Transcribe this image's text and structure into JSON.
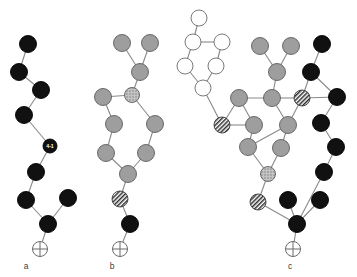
{
  "figure": {
    "background_color": "#ffffff",
    "width": 357,
    "height": 277,
    "edge_color": "#8a8a8a",
    "node_colors": {
      "black": "#111111",
      "gray": "#9e9e9e",
      "white": "#ffffff",
      "hatch": "#3a3a3a",
      "speck": "#b4b4b4",
      "outline": "#5e5e5e"
    }
  },
  "panels": [
    {
      "id": "a",
      "label": "a",
      "label_pos": {
        "x": 26,
        "y": 269
      },
      "root_marker": {
        "name": "crossed-circle-root",
        "x": 40,
        "y": 249,
        "r": 7.5
      },
      "nodes": [
        {
          "id": "a0",
          "x": 28,
          "y": 44,
          "r": 8.5,
          "style": "black",
          "label": ""
        },
        {
          "id": "a1",
          "x": 19,
          "y": 72,
          "r": 8.5,
          "style": "black",
          "label": ""
        },
        {
          "id": "a2",
          "x": 41,
          "y": 90,
          "r": 8.5,
          "style": "black",
          "label": ""
        },
        {
          "id": "a3",
          "x": 24,
          "y": 115,
          "r": 8.5,
          "style": "black",
          "label": ""
        },
        {
          "id": "a4",
          "x": 50,
          "y": 146,
          "r": 7.0,
          "style": "black",
          "label": "4-1"
        },
        {
          "id": "a5",
          "x": 36,
          "y": 172,
          "r": 8.5,
          "style": "black",
          "label": ""
        },
        {
          "id": "a6",
          "x": 26,
          "y": 200,
          "r": 8.5,
          "style": "black",
          "label": ""
        },
        {
          "id": "a7",
          "x": 68,
          "y": 198,
          "r": 8.5,
          "style": "black",
          "label": ""
        },
        {
          "id": "a8",
          "x": 48,
          "y": 224,
          "r": 8.5,
          "style": "black",
          "label": ""
        }
      ],
      "edges": [
        [
          "a0",
          "a1"
        ],
        [
          "a1",
          "a2"
        ],
        [
          "a2",
          "a3"
        ],
        [
          "a3",
          "a4"
        ],
        [
          "a4",
          "a5"
        ],
        [
          "a5",
          "a6"
        ],
        [
          "a6",
          "a8"
        ],
        [
          "a7",
          "a8"
        ]
      ],
      "root_edge_from": "a8"
    },
    {
      "id": "b",
      "label": "b",
      "label_pos": {
        "x": 112,
        "y": 269
      },
      "root_marker": {
        "name": "crossed-circle-root",
        "x": 120,
        "y": 249,
        "r": 7.5
      },
      "nodes": [
        {
          "id": "b0",
          "x": 122,
          "y": 43,
          "r": 8.5,
          "style": "gray",
          "label": ""
        },
        {
          "id": "b1",
          "x": 150,
          "y": 43,
          "r": 8.5,
          "style": "gray",
          "label": ""
        },
        {
          "id": "b2",
          "x": 140,
          "y": 72,
          "r": 8.5,
          "style": "gray",
          "label": ""
        },
        {
          "id": "b3",
          "x": 103,
          "y": 97,
          "r": 8.5,
          "style": "gray",
          "label": ""
        },
        {
          "id": "b4",
          "x": 132,
          "y": 95,
          "r": 7.5,
          "style": "speck",
          "label": ""
        },
        {
          "id": "b5",
          "x": 114,
          "y": 124,
          "r": 8.5,
          "style": "gray",
          "label": ""
        },
        {
          "id": "b6",
          "x": 155,
          "y": 124,
          "r": 8.5,
          "style": "gray",
          "label": ""
        },
        {
          "id": "b7",
          "x": 106,
          "y": 153,
          "r": 8.5,
          "style": "gray",
          "label": ""
        },
        {
          "id": "b8",
          "x": 146,
          "y": 153,
          "r": 8.5,
          "style": "gray",
          "label": ""
        },
        {
          "id": "b9",
          "x": 128,
          "y": 174,
          "r": 8.5,
          "style": "gray",
          "label": ""
        },
        {
          "id": "b10",
          "x": 120,
          "y": 199,
          "r": 8.0,
          "style": "hatch",
          "label": ""
        },
        {
          "id": "b11",
          "x": 130,
          "y": 224,
          "r": 8.5,
          "style": "black",
          "label": ""
        }
      ],
      "edges": [
        [
          "b0",
          "b2"
        ],
        [
          "b1",
          "b2"
        ],
        [
          "b2",
          "b4"
        ],
        [
          "b3",
          "b4"
        ],
        [
          "b3",
          "b5"
        ],
        [
          "b4",
          "b6"
        ],
        [
          "b5",
          "b7"
        ],
        [
          "b6",
          "b8"
        ],
        [
          "b7",
          "b9"
        ],
        [
          "b8",
          "b9"
        ],
        [
          "b9",
          "b10"
        ],
        [
          "b10",
          "b11"
        ]
      ],
      "root_edge_from": "b11"
    },
    {
      "id": "c",
      "label": "c",
      "label_pos": {
        "x": 290,
        "y": 269
      },
      "root_marker": {
        "name": "crossed-circle-root",
        "x": 293,
        "y": 249,
        "r": 7.5
      },
      "nodes": [
        {
          "id": "c0",
          "x": 199,
          "y": 18,
          "r": 8.0,
          "style": "white",
          "label": ""
        },
        {
          "id": "c1",
          "x": 193,
          "y": 42,
          "r": 8.0,
          "style": "white",
          "label": ""
        },
        {
          "id": "c2",
          "x": 222,
          "y": 42,
          "r": 8.0,
          "style": "white",
          "label": ""
        },
        {
          "id": "c3",
          "x": 185,
          "y": 66,
          "r": 8.0,
          "style": "white",
          "label": ""
        },
        {
          "id": "c4",
          "x": 216,
          "y": 66,
          "r": 8.0,
          "style": "white",
          "label": ""
        },
        {
          "id": "c5",
          "x": 203,
          "y": 88,
          "r": 8.0,
          "style": "white",
          "label": ""
        },
        {
          "id": "c6",
          "x": 260,
          "y": 46,
          "r": 8.5,
          "style": "gray",
          "label": ""
        },
        {
          "id": "c7",
          "x": 291,
          "y": 46,
          "r": 8.5,
          "style": "gray",
          "label": ""
        },
        {
          "id": "c8",
          "x": 277,
          "y": 72,
          "r": 8.5,
          "style": "gray",
          "label": ""
        },
        {
          "id": "c9",
          "x": 322,
          "y": 44,
          "r": 8.5,
          "style": "black",
          "label": ""
        },
        {
          "id": "c10",
          "x": 311,
          "y": 72,
          "r": 8.5,
          "style": "black",
          "label": ""
        },
        {
          "id": "c11",
          "x": 239,
          "y": 98,
          "r": 8.5,
          "style": "gray",
          "label": ""
        },
        {
          "id": "c12",
          "x": 272,
          "y": 98,
          "r": 8.5,
          "style": "gray",
          "label": ""
        },
        {
          "id": "c13",
          "x": 302,
          "y": 98,
          "r": 8.0,
          "style": "hatch",
          "label": ""
        },
        {
          "id": "c14",
          "x": 337,
          "y": 97,
          "r": 8.5,
          "style": "black",
          "label": ""
        },
        {
          "id": "c15",
          "x": 222,
          "y": 125,
          "r": 8.0,
          "style": "hatch",
          "label": ""
        },
        {
          "id": "c16",
          "x": 254,
          "y": 125,
          "r": 8.5,
          "style": "gray",
          "label": ""
        },
        {
          "id": "c17",
          "x": 288,
          "y": 125,
          "r": 8.5,
          "style": "gray",
          "label": ""
        },
        {
          "id": "c18",
          "x": 321,
          "y": 123,
          "r": 8.5,
          "style": "black",
          "label": ""
        },
        {
          "id": "c19",
          "x": 248,
          "y": 147,
          "r": 8.5,
          "style": "gray",
          "label": ""
        },
        {
          "id": "c20",
          "x": 281,
          "y": 148,
          "r": 8.5,
          "style": "gray",
          "label": ""
        },
        {
          "id": "c21",
          "x": 336,
          "y": 147,
          "r": 8.5,
          "style": "black",
          "label": ""
        },
        {
          "id": "c22",
          "x": 268,
          "y": 174,
          "r": 7.5,
          "style": "speck",
          "label": ""
        },
        {
          "id": "c23",
          "x": 324,
          "y": 172,
          "r": 8.5,
          "style": "black",
          "label": ""
        },
        {
          "id": "c24",
          "x": 258,
          "y": 202,
          "r": 8.0,
          "style": "hatch",
          "label": ""
        },
        {
          "id": "c25",
          "x": 288,
          "y": 200,
          "r": 8.5,
          "style": "black",
          "label": ""
        },
        {
          "id": "c26",
          "x": 320,
          "y": 200,
          "r": 8.5,
          "style": "black",
          "label": ""
        },
        {
          "id": "c27",
          "x": 297,
          "y": 224,
          "r": 8.5,
          "style": "black",
          "label": ""
        }
      ],
      "edges": [
        [
          "c0",
          "c1"
        ],
        [
          "c1",
          "c2"
        ],
        [
          "c1",
          "c3"
        ],
        [
          "c2",
          "c4"
        ],
        [
          "c3",
          "c5"
        ],
        [
          "c4",
          "c5"
        ],
        [
          "c5",
          "c15"
        ],
        [
          "c6",
          "c8"
        ],
        [
          "c7",
          "c8"
        ],
        [
          "c8",
          "c12"
        ],
        [
          "c9",
          "c10"
        ],
        [
          "c10",
          "c13"
        ],
        [
          "c10",
          "c14"
        ],
        [
          "c13",
          "c14"
        ],
        [
          "c11",
          "c12"
        ],
        [
          "c11",
          "c15"
        ],
        [
          "c12",
          "c13"
        ],
        [
          "c12",
          "c17"
        ],
        [
          "c11",
          "c16"
        ],
        [
          "c14",
          "c18"
        ],
        [
          "c13",
          "c17"
        ],
        [
          "c15",
          "c16"
        ],
        [
          "c16",
          "c19"
        ],
        [
          "c17",
          "c19"
        ],
        [
          "c17",
          "c20"
        ],
        [
          "c18",
          "c21"
        ],
        [
          "c19",
          "c22"
        ],
        [
          "c20",
          "c22"
        ],
        [
          "c21",
          "c23"
        ],
        [
          "c22",
          "c24"
        ],
        [
          "c23",
          "c27"
        ],
        [
          "c24",
          "c27"
        ],
        [
          "c25",
          "c27"
        ],
        [
          "c26",
          "c27"
        ]
      ],
      "root_edge_from": "c27"
    }
  ]
}
